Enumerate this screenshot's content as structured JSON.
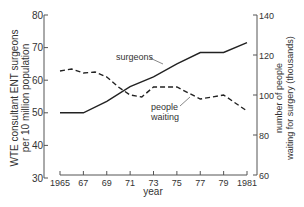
{
  "chart_data": {
    "type": "line",
    "title": "",
    "xlabel": "year",
    "ylabel_left": "WTE consultant ENT surgeons per 10 million population",
    "ylabel_right": "number of people waiting for surgery (thousands)",
    "x_ticks": [
      "1965",
      "67",
      "69",
      "71",
      "73",
      "75",
      "77",
      "79",
      "1981"
    ],
    "xlim": [
      1965,
      1981
    ],
    "ylim_left": [
      30,
      80
    ],
    "ylim_right": [
      60,
      140
    ],
    "y_ticks_left": [
      "30",
      "40",
      "50",
      "60",
      "70",
      "80"
    ],
    "y_ticks_right": [
      "60",
      "80",
      "100",
      "120",
      "140"
    ],
    "grid": false,
    "legend": "inline labels",
    "series": [
      {
        "name": "surgeons",
        "axis": "left",
        "style": "solid",
        "x": [
          1965,
          1967,
          1969,
          1971,
          1973,
          1975,
          1977,
          1979,
          1981
        ],
        "values": [
          50,
          50,
          53.5,
          58,
          61,
          65,
          68.5,
          68.5,
          71.5
        ]
      },
      {
        "name": "people waiting",
        "axis": "right",
        "style": "dashed",
        "x": [
          1965,
          1966,
          1967,
          1968,
          1969,
          1970,
          1971,
          1972,
          1973,
          1975,
          1977,
          1979,
          1981
        ],
        "values": [
          112,
          113,
          111,
          111.5,
          109,
          104,
          100,
          99,
          104,
          104,
          98,
          100,
          92
        ]
      }
    ],
    "annotations": [
      {
        "text": "surgeons",
        "series": "surgeons"
      },
      {
        "text": "people waiting",
        "series": "people waiting"
      }
    ]
  },
  "labels": {
    "xlabel": "year",
    "ylabel_left_line1": "WTE consultant ENT surgeons",
    "ylabel_left_line2": "per 10 million population",
    "ylabel_right_line1": "number of people",
    "ylabel_right_line2": "waiting for surgery (thousands)",
    "annot_surgeons": "surgeons",
    "annot_people": "people",
    "annot_waiting": "waiting"
  }
}
